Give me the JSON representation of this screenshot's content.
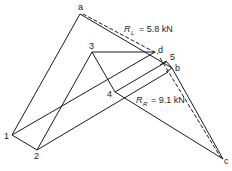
{
  "diagram": {
    "type": "force-polygon-and-funicular",
    "labels": {
      "a": "a",
      "b": "b",
      "c": "c",
      "d": "d",
      "n1": "1",
      "n2": "2",
      "n3": "3",
      "n4": "4",
      "n5": "5"
    },
    "reactions": {
      "left": {
        "symbol": "R",
        "subscript": "L",
        "value": "= 5.8 kN"
      },
      "right": {
        "symbol": "R",
        "subscript": "R",
        "value": "= 9.1 kN"
      }
    },
    "colors": {
      "line": "#1a1a1a",
      "background": "#ffffff"
    }
  }
}
